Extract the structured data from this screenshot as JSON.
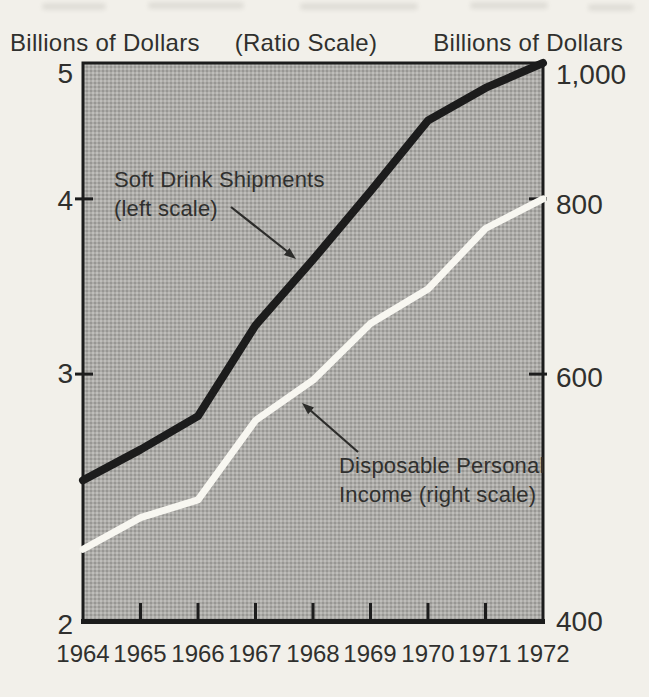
{
  "chart_data": {
    "type": "line",
    "title": "(Ratio Scale)",
    "scale_note": "ratio (logarithmic) vertical scales",
    "x_categories": [
      "1964",
      "1965",
      "1966",
      "1967",
      "1968",
      "1969",
      "1970",
      "1971",
      "1972"
    ],
    "left_axis": {
      "title": "Billions of Dollars",
      "scale": "log",
      "range": [
        2,
        5
      ],
      "tick_labels": [
        "5",
        "4",
        "3",
        "2"
      ],
      "tick_values": [
        5,
        4,
        3,
        2
      ],
      "inner_tick_values": [
        4,
        3
      ]
    },
    "right_axis": {
      "title": "Billions of Dollars",
      "scale": "log",
      "range": [
        400,
        1000
      ],
      "tick_labels": [
        "1,000",
        "800",
        "600",
        "400"
      ],
      "tick_values": [
        1000,
        800,
        600,
        400
      ],
      "inner_tick_values": [
        800,
        600
      ]
    },
    "series": [
      {
        "name": "Soft Drink Shipments",
        "scale": "left",
        "color": "#1c1c1c",
        "values": [
          2.52,
          2.65,
          2.8,
          3.25,
          3.62,
          4.05,
          4.55,
          4.8,
          5.0
        ]
      },
      {
        "name": "Disposable Personal Income",
        "scale": "right",
        "color": "#f8f7f1",
        "values": [
          450,
          474,
          488,
          556,
          594,
          652,
          690,
          762,
          800
        ]
      }
    ],
    "annotations": [
      {
        "lines": [
          "Soft Drink Shipments",
          "(left scale)"
        ]
      },
      {
        "lines": [
          "Disposable Personal",
          "Income (right scale)"
        ]
      }
    ],
    "plot_background": "#adaca8",
    "grid": "off",
    "legend": "none"
  }
}
